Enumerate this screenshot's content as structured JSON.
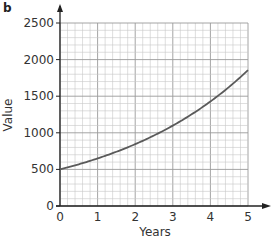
{
  "panel_label": "b",
  "chart_data": {
    "type": "line",
    "title": "",
    "xlabel": "Years",
    "ylabel": "Value",
    "xlim": [
      0,
      5
    ],
    "ylim": [
      0,
      2500
    ],
    "xticks": [
      0,
      1,
      2,
      3,
      4,
      5
    ],
    "yticks": [
      0,
      500,
      1000,
      1500,
      2000,
      2500
    ],
    "grid": true,
    "legend": null,
    "series": [
      {
        "name": "Value",
        "x": [
          0,
          1,
          2,
          3,
          4,
          5
        ],
        "y": [
          500,
          650,
          845,
          1099,
          1428,
          1856
        ]
      }
    ],
    "line_color": "#5a5a5a",
    "grid_color": "#c8c8c8"
  }
}
